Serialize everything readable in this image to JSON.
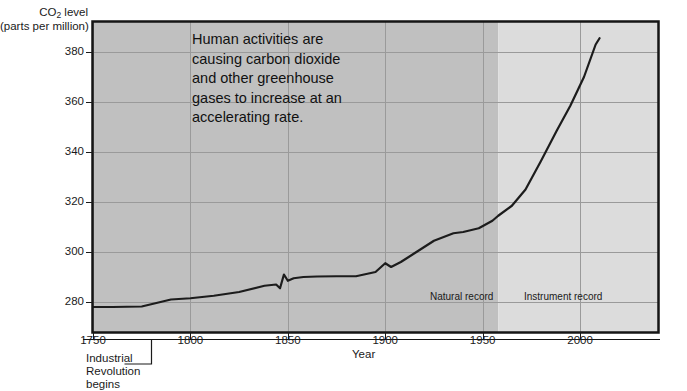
{
  "chart_data": {
    "type": "line",
    "title": "",
    "xlabel": "Year",
    "ylabel_line1": "CO2 level",
    "ylabel_line2": "(parts per million)",
    "ylabel_sub": "2",
    "ylabel_pre": "CO",
    "ylabel_post": " level",
    "xlim": [
      1750,
      2040
    ],
    "ylim": [
      268,
      392
    ],
    "xticks": [
      1750,
      1800,
      1850,
      1900,
      1950,
      2000
    ],
    "xtick_labels": [
      "1750",
      "1800",
      "1850",
      "1900",
      "1950",
      "2000"
    ],
    "yticks": [
      280,
      300,
      320,
      340,
      360,
      380
    ],
    "ytick_labels": [
      "280",
      "300",
      "320",
      "340",
      "360",
      "380"
    ],
    "grid": true,
    "legend": "none",
    "series": [
      {
        "name": "CO2 concentration",
        "color": "#1c1c1c",
        "x": [
          1750,
          1760,
          1775,
          1782,
          1790,
          1800,
          1812,
          1825,
          1838,
          1844,
          1846,
          1848,
          1850,
          1853,
          1858,
          1865,
          1875,
          1885,
          1895,
          1900,
          1903,
          1908,
          1915,
          1925,
          1935,
          1940,
          1948,
          1955,
          1958,
          1965,
          1972,
          1980,
          1988,
          1995,
          2002,
          2008,
          2010
        ],
        "y": [
          278.0,
          278.0,
          278.2,
          279.5,
          281.0,
          281.5,
          282.5,
          284.0,
          286.5,
          287.0,
          285.5,
          291.0,
          288.5,
          289.5,
          290.0,
          290.2,
          290.3,
          290.3,
          292.0,
          295.5,
          294.0,
          296.0,
          299.5,
          304.5,
          307.5,
          308.0,
          309.5,
          312.5,
          314.5,
          318.5,
          325.0,
          336.5,
          348.5,
          358.5,
          370.0,
          383.0,
          385.5
        ]
      }
    ],
    "shaded_regions": [
      {
        "name": "natural-record",
        "from": 1750,
        "to": 1958,
        "color": "#c0c0c0"
      },
      {
        "name": "instrument-record",
        "from": 1958,
        "to": 2040,
        "color": "#dcdcdc"
      }
    ],
    "annotations": [
      {
        "name": "human-activities-note",
        "text": "Human activities are\ncausing carbon dioxide\nand other greenhouse\ngases to increase at an\naccelerating rate."
      },
      {
        "name": "natural-record-label",
        "text": "Natural record"
      },
      {
        "name": "instrument-record-label",
        "text": "Instrument record"
      },
      {
        "name": "industrial-revolution-label",
        "text": "Industrial\nRevolution\nbegins",
        "x": 1780
      }
    ],
    "colors": {
      "plot_bg_left": "#c0c0c0",
      "plot_bg_right": "#dcdcdc",
      "gridline": "#9a9a9a",
      "frame": "#151515",
      "curve": "#1c1c1c",
      "text": "#1a1a1a",
      "page_bg": "#ffffff"
    }
  }
}
